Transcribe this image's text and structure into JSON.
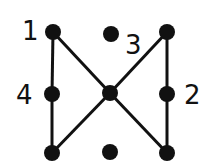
{
  "diagram": {
    "title": "",
    "nodes": [
      {
        "id": "tl",
        "x": 53,
        "y": 32
      },
      {
        "id": "tm",
        "x": 111,
        "y": 34
      },
      {
        "id": "tr",
        "x": 167,
        "y": 32
      },
      {
        "id": "ml",
        "x": 52,
        "y": 94
      },
      {
        "id": "c",
        "x": 110,
        "y": 93
      },
      {
        "id": "mr",
        "x": 167,
        "y": 94
      },
      {
        "id": "bl",
        "x": 52,
        "y": 153
      },
      {
        "id": "bm",
        "x": 110,
        "y": 152
      },
      {
        "id": "br",
        "x": 167,
        "y": 153
      }
    ],
    "edges": [
      [
        "tl",
        "ml"
      ],
      [
        "ml",
        "bl"
      ],
      [
        "tl",
        "c"
      ],
      [
        "c",
        "br"
      ],
      [
        "tr",
        "mr"
      ],
      [
        "mr",
        "br"
      ],
      [
        "tr",
        "c"
      ],
      [
        "c",
        "bl"
      ]
    ],
    "labels": [
      {
        "text": "1",
        "x": 22,
        "y": 40
      },
      {
        "text": "3",
        "x": 125,
        "y": 54
      },
      {
        "text": "4",
        "x": 16,
        "y": 104
      },
      {
        "text": "2",
        "x": 184,
        "y": 104
      }
    ],
    "colors": {
      "stroke": "#111111",
      "background": "#ffffff"
    }
  }
}
